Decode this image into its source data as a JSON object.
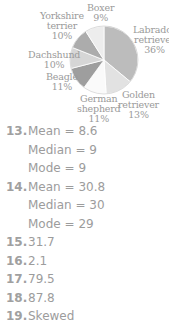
{
  "chart_data": {
    "type": "pie",
    "title": "",
    "categories": [
      "Labrador retriever",
      "Golden retriever",
      "German shepherd",
      "Beagle",
      "Dachshund",
      "Yorkshire terrier",
      "Boxer"
    ],
    "values": [
      36,
      13,
      11,
      11,
      10,
      10,
      9
    ],
    "unit": "%",
    "colors": [
      "#bcbcbc",
      "#e2e2e2",
      "#fafafa",
      "#9e9e9e",
      "#d6d6d6",
      "#acacac",
      "#ededed"
    ],
    "start_angle": "12 o'clock, clockwise"
  },
  "labels": {
    "boxer": {
      "name": "Boxer",
      "pct": "9%"
    },
    "yorkshire": {
      "name1": "Yorkshire",
      "name2": "terrier",
      "pct": "10%"
    },
    "labrador": {
      "name1": "Labrador",
      "name2": "retriever",
      "pct": "36%"
    },
    "dachshund": {
      "name": "Dachshund",
      "pct": "10%"
    },
    "beagle": {
      "name": "Beagle",
      "pct": "11%"
    },
    "german": {
      "name1": "German",
      "name2": "shepherd",
      "pct": "11%"
    },
    "golden": {
      "name1": "Golden",
      "name2": "retriever",
      "pct": "13%"
    }
  },
  "answers": [
    {
      "num": "13.",
      "text": "Mean = 8.6"
    },
    {
      "num": "",
      "text": "Median = 9"
    },
    {
      "num": "",
      "text": "Mode = 9"
    },
    {
      "num": "14.",
      "text": "Mean = 30.8"
    },
    {
      "num": "",
      "text": "Median = 30"
    },
    {
      "num": "",
      "text": "Mode = 29"
    },
    {
      "num": "15.",
      "text": "31.7"
    },
    {
      "num": "16.",
      "text": "2.1"
    },
    {
      "num": "17.",
      "text": "79.5"
    },
    {
      "num": "18.",
      "text": "87.8"
    },
    {
      "num": "19.",
      "text": "Skewed"
    }
  ]
}
